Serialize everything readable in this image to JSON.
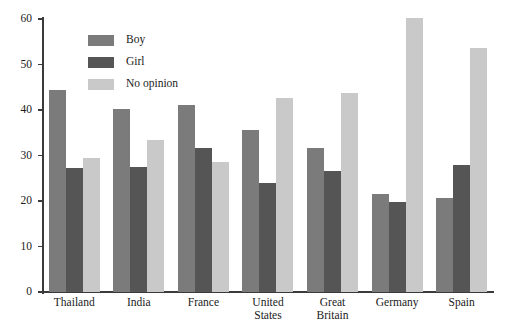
{
  "chart_data": {
    "type": "bar",
    "title": "",
    "xlabel": "",
    "ylabel": "",
    "ylim": [
      0,
      60
    ],
    "yticks": [
      0,
      10,
      20,
      30,
      40,
      50,
      60
    ],
    "grid": false,
    "legend_position": "top-left-inside",
    "categories": [
      "Thailand",
      "India",
      "France",
      "United\nStates",
      "Great\nBritain",
      "Germany",
      "Spain"
    ],
    "series": [
      {
        "name": "Boy",
        "color": "#7b7b7b",
        "values": [
          44.4,
          40.3,
          41.2,
          35.5,
          31.6,
          21.6,
          20.7
        ]
      },
      {
        "name": "Girl",
        "color": "#555555",
        "values": [
          27.3,
          27.4,
          31.6,
          23.9,
          26.7,
          19.8,
          28.0
        ]
      },
      {
        "name": "No opinion",
        "color": "#c9c9c9",
        "values": [
          29.4,
          33.4,
          28.6,
          42.6,
          43.8,
          60.2,
          53.7
        ]
      }
    ]
  },
  "axis": {
    "y_tick_labels": [
      "0",
      "10",
      "20",
      "30",
      "40",
      "50",
      "60"
    ]
  },
  "legend": {
    "entries": [
      {
        "label": "Boy"
      },
      {
        "label": "Girl"
      },
      {
        "label": "No opinion"
      }
    ]
  },
  "colors": {
    "boy": "#7b7b7b",
    "girl": "#555555",
    "no_opinion": "#c9c9c9",
    "axis": "#3a3a3a",
    "text": "#1a1a1a",
    "background": "#ffffff"
  }
}
